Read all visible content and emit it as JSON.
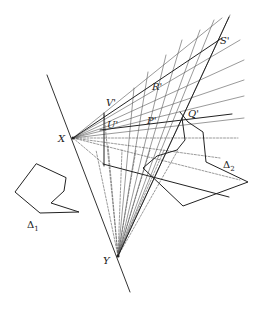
{
  "figure": {
    "type": "geometric-construction",
    "stroke_color": "#333333",
    "background": "#ffffff"
  },
  "labels": {
    "X": "X",
    "Y": "Y",
    "S": "S'",
    "R": "R'",
    "V": "V'",
    "U": "U'",
    "P": "P'",
    "Q": "Q'",
    "delta1": "Δ",
    "delta1_sub": "1",
    "delta2": "Δ",
    "delta2_sub": "2"
  },
  "points": {
    "X": [
      73,
      138
    ],
    "Y": [
      118,
      256
    ],
    "S": [
      222,
      38
    ],
    "R": [
      158,
      87
    ],
    "V": [
      108,
      103
    ],
    "U": [
      110,
      125
    ],
    "P": [
      149,
      122
    ],
    "Q": [
      193,
      115
    ]
  },
  "polygons": {
    "delta1": [
      [
        36,
        164
      ],
      [
        15,
        192
      ],
      [
        40,
        213
      ],
      [
        79,
        212
      ],
      [
        51,
        203
      ],
      [
        64,
        191
      ],
      [
        66,
        178
      ]
    ],
    "delta2": [
      [
        177,
        150
      ],
      [
        143,
        168
      ],
      [
        183,
        206
      ],
      [
        248,
        182
      ],
      [
        206,
        162
      ],
      [
        203,
        132
      ],
      [
        188,
        122
      ],
      [
        180,
        112
      ]
    ]
  }
}
